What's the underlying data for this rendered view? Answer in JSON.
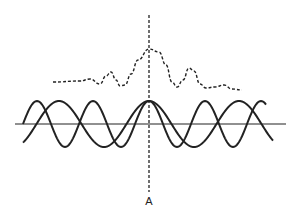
{
  "diagram": {
    "marker_label": "A",
    "colors": {
      "line": "#222222",
      "background": "#ffffff"
    },
    "axis": {
      "y": 124,
      "x_start": 15,
      "x_end": 286
    },
    "center_line": {
      "x": 149,
      "y_start": 15,
      "y_end": 192,
      "style": "dashed"
    },
    "wave_1": {
      "period_px": 90,
      "amplitude_px": 23,
      "peak_x": 149,
      "x_start": 23,
      "x_end": 273
    },
    "wave_2": {
      "period_px": 56,
      "amplitude_px": 23,
      "peak_x": 149,
      "x_start": 23,
      "x_end": 266
    },
    "envelope_points": [
      [
        53,
        82
      ],
      [
        80,
        81
      ],
      [
        90,
        79
      ],
      [
        100,
        84
      ],
      [
        106,
        76
      ],
      [
        111,
        72
      ],
      [
        116,
        80
      ],
      [
        120,
        86
      ],
      [
        125,
        85
      ],
      [
        131,
        74
      ],
      [
        138,
        60
      ],
      [
        149,
        49
      ],
      [
        159,
        52
      ],
      [
        166,
        65
      ],
      [
        172,
        82
      ],
      [
        177,
        87
      ],
      [
        183,
        80
      ],
      [
        189,
        68
      ],
      [
        194,
        71
      ],
      [
        200,
        84
      ],
      [
        206,
        88
      ],
      [
        215,
        87
      ],
      [
        224,
        85
      ],
      [
        232,
        89
      ],
      [
        242,
        90
      ]
    ]
  }
}
